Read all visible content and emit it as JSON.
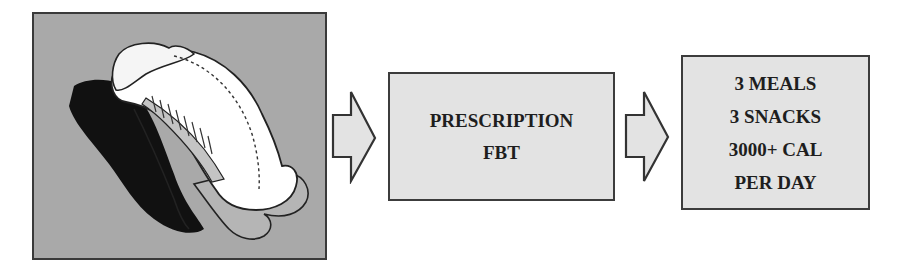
{
  "diagram": {
    "illustration": {
      "icon": "curled-figure-illustration",
      "background_color": "#a9a9a9"
    },
    "arrows": [
      {
        "icon": "right-arrow-icon",
        "fill": "#e3e3e3"
      },
      {
        "icon": "right-arrow-icon",
        "fill": "#e3e3e3"
      }
    ],
    "boxes": [
      {
        "lines": [
          "PRESCRIPTION",
          "FBT"
        ],
        "fill": "#e3e3e3"
      },
      {
        "lines": [
          "3 MEALS",
          "3 SNACKS",
          "3000+ CAL",
          "PER DAY"
        ],
        "fill": "#e3e3e3"
      }
    ]
  }
}
